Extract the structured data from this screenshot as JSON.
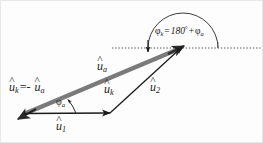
{
  "figure": {
    "background_color": "#fdfdfd",
    "ink_color": "#1b1b1b",
    "vector_color": "#7a7a7a"
  },
  "labels": {
    "uk_equals_minus_ua": {
      "hat": "^",
      "symbol": "u",
      "sub_k": "k",
      "equals": "=-",
      "symbol2": "u",
      "sub_a": "a"
    },
    "ua_top": {
      "hat": "^",
      "symbol": "u",
      "sub": "a"
    },
    "uk_mid": {
      "hat": "^",
      "symbol": "u",
      "sub": "k"
    },
    "u2": {
      "hat": "^",
      "symbol": "u",
      "sub": "2"
    },
    "u1": {
      "hat": "^",
      "symbol": "u",
      "sub": "1"
    },
    "phi_a": {
      "symbol": "φ",
      "sub": "a"
    },
    "phi_k_equation": {
      "symbol": "φ",
      "sub": "k",
      "equals": "=",
      "value": "180",
      "degree": "°",
      "plus": "+",
      "symbol2": "φ",
      "sub2": "a"
    }
  },
  "geometry": {
    "origin": {
      "x": 24,
      "y": 114
    },
    "u1_tip": {
      "x": 110,
      "y": 113
    },
    "ua_tip": {
      "x": 183,
      "y": 46
    },
    "uk_tip": {
      "x": 20,
      "y": 118
    },
    "u2_start": {
      "x": 110,
      "y": 113
    },
    "u2_tip": {
      "x": 183,
      "y": 46
    },
    "dotted_axis_y": 48,
    "dotted_axis_x_start": 112,
    "dotted_axis_x_end": 262,
    "arc_left_x": 148,
    "arc_right_x": 218,
    "arc_peak_y": 12
  }
}
